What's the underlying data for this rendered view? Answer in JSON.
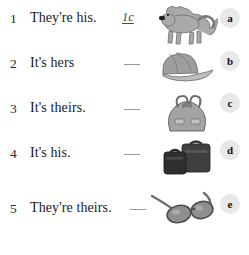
{
  "worksheet": {
    "rows": [
      {
        "number": "1",
        "sentence": "They're his.",
        "answer": "1c",
        "answer_filled": true,
        "picture": "dog-picture",
        "badge": "a"
      },
      {
        "number": "2",
        "sentence": "It's hers",
        "answer": "",
        "answer_filled": false,
        "picture": "baseball-cap-picture",
        "badge": "b"
      },
      {
        "number": "3",
        "sentence": "It's theirs.",
        "answer": "",
        "answer_filled": false,
        "picture": "handbag-picture",
        "badge": "c"
      },
      {
        "number": "4",
        "sentence": "It's his.",
        "answer": "",
        "answer_filled": false,
        "picture": "luggage-picture",
        "badge": "d"
      },
      {
        "number": "5",
        "sentence": "They're theirs.",
        "answer": "",
        "answer_filled": false,
        "picture": "sunglasses-picture",
        "badge": "e"
      }
    ]
  },
  "colors": {
    "page_background": "#ffffff",
    "text": "#1a1a1a",
    "answer_ink": "#4a4a4a",
    "blank_rule": "#9a9a9a",
    "badge_background": "#e8e8e8",
    "badge_text": "#111111",
    "illustration_gray": "#a8a8a8",
    "illustration_dark": "#3a3a3a"
  }
}
